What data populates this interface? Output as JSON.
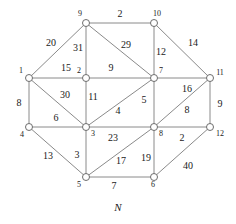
{
  "figure": {
    "caption": "N",
    "caption_pos": [
      118,
      207
    ],
    "background_color": "#ffffff",
    "edge_color": "#8a8a8a",
    "node_fill": "#ffffff",
    "node_stroke": "#6d6d6d",
    "text_color": "#1a1a1a"
  },
  "graph": {
    "type": "weighted-undirected-graph",
    "node_radius": 3.5,
    "nodes": [
      {
        "id": "1",
        "label": "1",
        "x": 29,
        "y": 78,
        "label_x": 21,
        "label_y": 71
      },
      {
        "id": "2",
        "label": "2",
        "x": 86,
        "y": 78,
        "label_x": 79,
        "label_y": 71
      },
      {
        "id": "3",
        "label": "3",
        "x": 86,
        "y": 127,
        "label_x": 93,
        "label_y": 134
      },
      {
        "id": "4",
        "label": "4",
        "x": 29,
        "y": 127,
        "label_x": 22,
        "label_y": 135
      },
      {
        "id": "5",
        "label": "5",
        "x": 86,
        "y": 177,
        "label_x": 79,
        "label_y": 185
      },
      {
        "id": "6",
        "label": "6",
        "x": 154,
        "y": 177,
        "label_x": 153,
        "label_y": 185
      },
      {
        "id": "7",
        "label": "7",
        "x": 154,
        "y": 78,
        "label_x": 161,
        "label_y": 71
      },
      {
        "id": "8",
        "label": "8",
        "x": 154,
        "y": 127,
        "label_x": 161,
        "label_y": 134
      },
      {
        "id": "9",
        "label": "9",
        "x": 86,
        "y": 23,
        "label_x": 80,
        "label_y": 14
      },
      {
        "id": "10",
        "label": "10",
        "x": 154,
        "y": 23,
        "label_x": 157,
        "label_y": 14
      },
      {
        "id": "11",
        "label": "11",
        "x": 210,
        "y": 78,
        "label_x": 220,
        "label_y": 73
      },
      {
        "id": "12",
        "label": "12",
        "x": 210,
        "y": 127,
        "label_x": 220,
        "label_y": 134
      }
    ],
    "edges": [
      {
        "from": "9",
        "to": "10",
        "weight": "2",
        "label_x": 120,
        "label_y": 14
      },
      {
        "from": "1",
        "to": "9",
        "weight": "20",
        "label_x": 51,
        "label_y": 43
      },
      {
        "from": "9",
        "to": "2",
        "weight": "31",
        "label_x": 78,
        "label_y": 48
      },
      {
        "from": "9",
        "to": "7",
        "weight": "29",
        "label_x": 126,
        "label_y": 45
      },
      {
        "from": "10",
        "to": "7",
        "weight": "12",
        "label_x": 161,
        "label_y": 52
      },
      {
        "from": "10",
        "to": "11",
        "weight": "14",
        "label_x": 193,
        "label_y": 43
      },
      {
        "from": "1",
        "to": "2",
        "weight": "15",
        "label_x": 66,
        "label_y": 68
      },
      {
        "from": "2",
        "to": "7",
        "weight": "9",
        "label_x": 111,
        "label_y": 68
      },
      {
        "from": "1",
        "to": "4",
        "weight": "8",
        "label_x": 19,
        "label_y": 103
      },
      {
        "from": "1",
        "to": "3",
        "weight": "30",
        "label_x": 65,
        "label_y": 95
      },
      {
        "from": "2",
        "to": "3",
        "weight": "11",
        "label_x": 93,
        "label_y": 97
      },
      {
        "from": "3",
        "to": "7",
        "weight": "4",
        "label_x": 118,
        "label_y": 111
      },
      {
        "from": "7",
        "to": "8",
        "weight": "5",
        "label_x": 144,
        "label_y": 100
      },
      {
        "from": "7",
        "to": "11",
        "weight": "16",
        "label_x": 187,
        "label_y": 89
      },
      {
        "from": "8",
        "to": "11",
        "weight": "8",
        "label_x": 187,
        "label_y": 110
      },
      {
        "from": "11",
        "to": "12",
        "weight": "9",
        "label_x": 220,
        "label_y": 104
      },
      {
        "from": "4",
        "to": "3",
        "weight": "6",
        "label_x": 56,
        "label_y": 118
      },
      {
        "from": "3",
        "to": "8",
        "weight": "23",
        "label_x": 113,
        "label_y": 138
      },
      {
        "from": "8",
        "to": "12",
        "weight": "2",
        "label_x": 182,
        "label_y": 138
      },
      {
        "from": "4",
        "to": "5",
        "weight": "13",
        "label_x": 48,
        "label_y": 156
      },
      {
        "from": "3",
        "to": "5",
        "weight": "3",
        "label_x": 77,
        "label_y": 155
      },
      {
        "from": "5",
        "to": "8",
        "weight": "17",
        "label_x": 121,
        "label_y": 161
      },
      {
        "from": "6",
        "to": "8",
        "weight": "19",
        "label_x": 146,
        "label_y": 158
      },
      {
        "from": "5",
        "to": "6",
        "weight": "7",
        "label_x": 114,
        "label_y": 186
      },
      {
        "from": "6",
        "to": "12",
        "weight": "40",
        "label_x": 188,
        "label_y": 166
      }
    ]
  }
}
